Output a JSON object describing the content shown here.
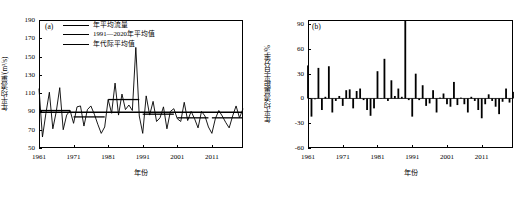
{
  "figure": {
    "panels": [
      {
        "tag": "(a)",
        "ylabel": "年平均流量/(m³/s)",
        "xlabel": "年份"
      },
      {
        "tag": "(b)",
        "ylabel": "年平均流量距平百分率/%",
        "xlabel": "年份"
      }
    ]
  },
  "legend": {
    "items": [
      {
        "label": "年平均流量",
        "color": "#000000"
      },
      {
        "label": "1991—2020年平均值",
        "color": "#000000"
      },
      {
        "label": "年代际平均值",
        "color": "#000000"
      }
    ]
  },
  "chart_data": [
    {
      "type": "line",
      "title": "",
      "panel": "(a)",
      "xlabel": "年份",
      "ylabel": "年平均流量/(m³/s)",
      "xlim": [
        1961,
        2020
      ],
      "ylim": [
        50,
        190
      ],
      "yticks": [
        50,
        70,
        90,
        110,
        130,
        150,
        170,
        190
      ],
      "xticks": [
        1961,
        1971,
        1981,
        1991,
        2001,
        2011
      ],
      "grid": false,
      "legend_position": "top-left-inside",
      "x": [
        1961,
        1962,
        1963,
        1964,
        1965,
        1966,
        1967,
        1968,
        1969,
        1970,
        1971,
        1972,
        1973,
        1974,
        1975,
        1976,
        1977,
        1978,
        1979,
        1980,
        1981,
        1982,
        1983,
        1984,
        1985,
        1986,
        1987,
        1988,
        1989,
        1990,
        1991,
        1992,
        1993,
        1994,
        1995,
        1996,
        1997,
        1998,
        1999,
        2000,
        2001,
        2002,
        2003,
        2004,
        2005,
        2006,
        2007,
        2008,
        2009,
        2010,
        2011,
        2012,
        2013,
        2014,
        2015,
        2016,
        2017,
        2018,
        2019,
        2020
      ],
      "series": [
        {
          "name": "年平均流量",
          "values": [
            115,
            62,
            88,
            111,
            71,
            90,
            116,
            70,
            86,
            91,
            77,
            95,
            96,
            74,
            92,
            96,
            87,
            76,
            66,
            73,
            103,
            88,
            121,
            86,
            109,
            92,
            97,
            91,
            160,
            85,
            66,
            107,
            86,
            101,
            79,
            83,
            95,
            71,
            90,
            93,
            82,
            79,
            100,
            80,
            90,
            82,
            72,
            90,
            85,
            73,
            66,
            82,
            91,
            85,
            78,
            72,
            85,
            96,
            83,
            93
          ]
        },
        {
          "name": "1991—2020年平均值",
          "values": [
            89,
            89,
            89,
            89,
            89,
            89,
            89,
            89,
            89,
            89,
            89,
            89,
            89,
            89,
            89,
            89,
            89,
            89,
            89,
            89,
            89,
            89,
            89,
            89,
            89,
            89,
            89,
            89,
            89,
            89,
            89,
            89,
            89,
            89,
            89,
            89,
            89,
            89,
            89,
            89,
            89,
            89,
            89,
            89,
            89,
            89,
            89,
            89,
            89,
            89,
            89,
            89,
            89,
            89,
            89,
            89,
            89,
            89,
            89,
            89
          ]
        },
        {
          "name": "年代际平均值",
          "decades": [
            {
              "start": 1961,
              "end": 1970,
              "value": 91
            },
            {
              "start": 1971,
              "end": 1980,
              "value": 84
            },
            {
              "start": 1981,
              "end": 1990,
              "value": 103
            },
            {
              "start": 1991,
              "end": 2000,
              "value": 87
            },
            {
              "start": 2001,
              "end": 2010,
              "value": 83
            },
            {
              "start": 2011,
              "end": 2020,
              "value": 83
            }
          ]
        }
      ]
    },
    {
      "type": "bar",
      "title": "",
      "panel": "(b)",
      "xlabel": "年份",
      "ylabel": "年平均流量距平百分率/%",
      "xlim": [
        1961,
        2020
      ],
      "ylim": [
        -60,
        95
      ],
      "yticks": [
        -60,
        -30,
        0,
        30,
        60,
        90
      ],
      "xticks": [
        1961,
        1971,
        1981,
        1991,
        2001,
        2011
      ],
      "grid": false,
      "categories": [
        1961,
        1962,
        1963,
        1964,
        1965,
        1966,
        1967,
        1968,
        1969,
        1970,
        1971,
        1972,
        1973,
        1974,
        1975,
        1976,
        1977,
        1978,
        1979,
        1980,
        1981,
        1982,
        1983,
        1984,
        1985,
        1986,
        1987,
        1988,
        1989,
        1990,
        1991,
        1992,
        1993,
        1994,
        1995,
        1996,
        1997,
        1998,
        1999,
        2000,
        2001,
        2002,
        2003,
        2004,
        2005,
        2006,
        2007,
        2008,
        2009,
        2010,
        2011,
        2012,
        2013,
        2014,
        2015,
        2016,
        2017,
        2018,
        2019,
        2020
      ],
      "values": [
        40,
        -22,
        -1,
        37,
        -14,
        2,
        39,
        -17,
        -3,
        3,
        -9,
        10,
        11,
        -12,
        9,
        12,
        -2,
        -14,
        -21,
        -12,
        33,
        0,
        48,
        -3,
        22,
        3,
        12,
        2,
        94,
        -2,
        -22,
        30,
        -2,
        16,
        -9,
        -6,
        10,
        -17,
        1,
        6,
        -7,
        -10,
        20,
        -8,
        1,
        -7,
        -17,
        2,
        -3,
        -14,
        -24,
        -7,
        5,
        -3,
        -10,
        -19,
        -4,
        12,
        -5,
        8
      ]
    }
  ]
}
